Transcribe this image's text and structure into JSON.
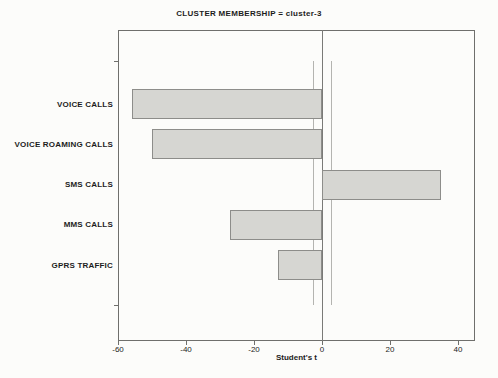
{
  "figure": {
    "kind": "scanned statistical profile plot"
  },
  "colors": {
    "background": "#fcfcfa",
    "text": "#1c1c1c",
    "frame": "#6f6f6c",
    "zero_line": "#7a7a77",
    "reference_line": "#b4b4b0",
    "bar_fill": "#d6d6d2",
    "bar_border": "#8d8d8a"
  },
  "chart_data": {
    "type": "bar",
    "orientation": "horizontal",
    "title": "CLUSTER MEMBERSHIP = cluster-3",
    "xlabel": "Student's t",
    "ylabel": "",
    "categories": [
      "VOICE CALLS",
      "VOICE ROAMING CALLS",
      "SMS CALLS",
      "MMS CALLS",
      "GPRS TRAFFIC"
    ],
    "values": [
      -56,
      -50,
      35,
      -27,
      -13
    ],
    "xlim": [
      -60,
      45
    ],
    "x_ticks": [
      -60,
      -40,
      -20,
      0,
      20,
      40
    ],
    "zero_line_x": 0,
    "reference_lines": [
      -2.6,
      2.7
    ],
    "grid": false,
    "legend_position": "none",
    "bar_fill": "#d6d6d2",
    "bar_border": "#8d8d8a"
  }
}
